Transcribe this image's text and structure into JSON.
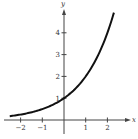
{
  "chart_data": {
    "type": "line",
    "title": "",
    "xlabel": "x",
    "ylabel": "y",
    "xlim": [
      -2.5,
      3.0
    ],
    "ylim": [
      0,
      5.0
    ],
    "grid": false,
    "legend": null,
    "x_ticks": [
      "-2",
      "-1",
      "1",
      "2"
    ],
    "y_ticks": [
      "1",
      "2",
      "3",
      "4"
    ],
    "series": [
      {
        "name": "y = 2^x",
        "function": "2^x",
        "x": [
          -2.5,
          -2,
          -1.5,
          -1,
          -0.5,
          0,
          0.5,
          1,
          1.5,
          2,
          2.3
        ],
        "y": [
          0.18,
          0.25,
          0.35,
          0.5,
          0.71,
          1,
          1.41,
          2,
          2.83,
          4,
          4.92
        ]
      }
    ],
    "annotations": []
  },
  "colors": {
    "curve": "#111111",
    "axis": "#444444",
    "background": "#ffffff"
  }
}
